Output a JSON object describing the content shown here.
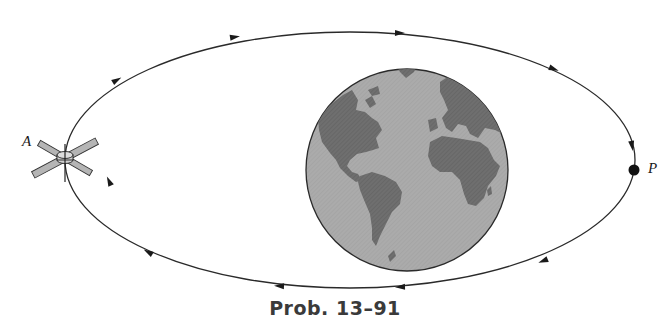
{
  "figure": {
    "caption": "Prob. 13–91",
    "labels": {
      "apogee": "A",
      "perigee": "P"
    },
    "orbit": {
      "shape": "ellipse",
      "direction": "clockwise",
      "arrow_count": 10
    },
    "earth": {
      "description": "globe showing the Americas, Europe and Africa"
    },
    "satellite": {
      "position": "A"
    },
    "colors": {
      "orbit_line": "#2a2a2a",
      "ocean": "#a8a8a8",
      "land": "#6e6e6e",
      "caption": "#3a3a3a"
    }
  }
}
